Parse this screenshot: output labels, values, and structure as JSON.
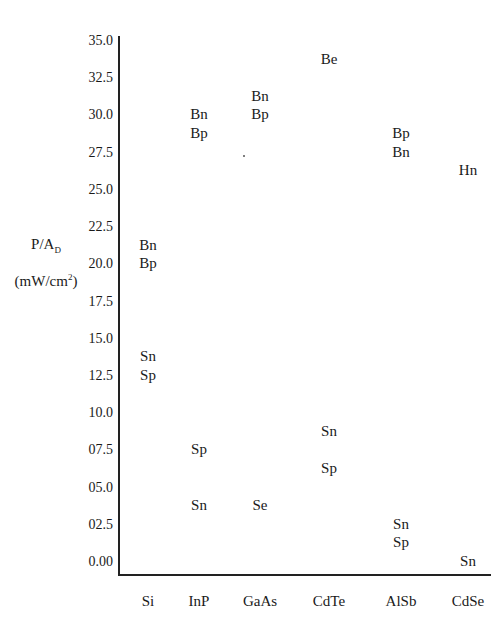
{
  "chart_data": {
    "type": "scatter",
    "title": "",
    "xlabel": "",
    "ylabel": "P/A_D (mW/cm²)",
    "ylabel_parts": {
      "main": "P/A",
      "sub": "D",
      "unit_pre": "(mW/cm",
      "unit_sup": "2",
      "unit_post": ")"
    },
    "ylim": [
      0,
      35
    ],
    "grid": false,
    "legend": "none",
    "categories": [
      "Si",
      "InP",
      "GaAs",
      "CdTe",
      "AlSb",
      "CdSe"
    ],
    "y_ticks": [
      "35.0",
      "32.5",
      "30.0",
      "27.5",
      "25.0",
      "22.5",
      "20.0",
      "17.5",
      "15.0",
      "12.5",
      "10.0",
      "07.5",
      "05.0",
      "02.5",
      "0.00"
    ],
    "y_tick_values": [
      35.0,
      32.5,
      30.0,
      27.5,
      25.0,
      22.5,
      20.0,
      17.5,
      15.0,
      12.5,
      10.0,
      7.5,
      5.0,
      2.5,
      0.0
    ],
    "points": [
      {
        "category": "Si",
        "label": "Bn",
        "y": 21.25
      },
      {
        "category": "Si",
        "label": "Bp",
        "y": 20.0
      },
      {
        "category": "Si",
        "label": "Sn",
        "y": 13.75
      },
      {
        "category": "Si",
        "label": "Sp",
        "y": 12.5
      },
      {
        "category": "InP",
        "label": "Bn",
        "y": 30.0
      },
      {
        "category": "InP",
        "label": "Bp",
        "y": 28.75
      },
      {
        "category": "InP",
        "label": "Sp",
        "y": 7.5
      },
      {
        "category": "InP",
        "label": "Sn",
        "y": 3.75
      },
      {
        "category": "GaAs",
        "label": "Bn",
        "y": 31.25
      },
      {
        "category": "GaAs",
        "label": "Bp",
        "y": 30.0
      },
      {
        "category": "GaAs",
        "label": "Se",
        "y": 3.75
      },
      {
        "category": "CdTe",
        "label": "Be",
        "y": 33.75
      },
      {
        "category": "CdTe",
        "label": "Sn",
        "y": 8.75
      },
      {
        "category": "CdTe",
        "label": "Sp",
        "y": 6.25
      },
      {
        "category": "AlSb",
        "label": "Bp",
        "y": 28.75
      },
      {
        "category": "AlSb",
        "label": "Bn",
        "y": 27.5
      },
      {
        "category": "AlSb",
        "label": "Sn",
        "y": 2.5
      },
      {
        "category": "AlSb",
        "label": "Sp",
        "y": 1.25
      },
      {
        "category": "CdSe",
        "label": "Hn",
        "y": 26.25
      },
      {
        "category": "CdSe",
        "label": "Sn",
        "y": 0.0
      }
    ]
  }
}
